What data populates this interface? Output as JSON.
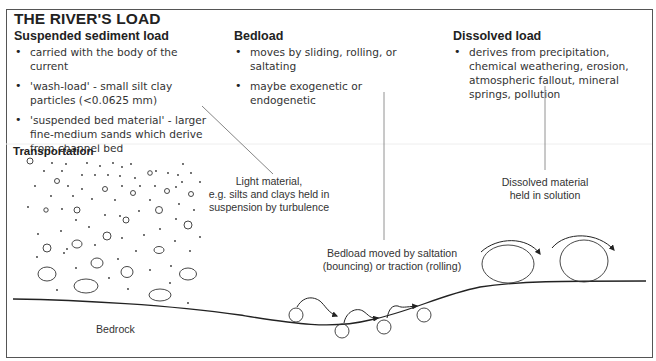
{
  "title": "THE RIVER'S LOAD",
  "sections": {
    "suspended": {
      "heading": "Suspended sediment load",
      "bullets": [
        "carried with the body of the current",
        "'wash-load' - small silt clay particles (<0.0625 mm)",
        "'suspended bed material' - larger fine-medium sands which derive from channel bed"
      ]
    },
    "bedload": {
      "heading": "Bedload",
      "bullets": [
        "moves by sliding, rolling, or saltating",
        "maybe exogenetic or endogenetic"
      ]
    },
    "dissolved": {
      "heading": "Dissolved load",
      "bullets": [
        "derives from precipitation, chemical weathering, erosion, atmospheric fallout, mineral springs, pollution"
      ]
    }
  },
  "diagram": {
    "transportation_label": "Transportation",
    "light_material_label": {
      "line1": "Light  material,",
      "line2": "e.g. silts and clays held in",
      "line3": "suspension by turbulence"
    },
    "dissolved_label": {
      "line1": "Dissolved material",
      "line2": "held in solution"
    },
    "bedload_label": {
      "line1": "Bedload moved by saltation",
      "line2": "(bouncing) or traction (rolling)"
    },
    "bedrock_label": "Bedrock"
  },
  "colors": {
    "text": "#333333",
    "line": "#444444",
    "border": "#555555",
    "background": "#ffffff"
  }
}
